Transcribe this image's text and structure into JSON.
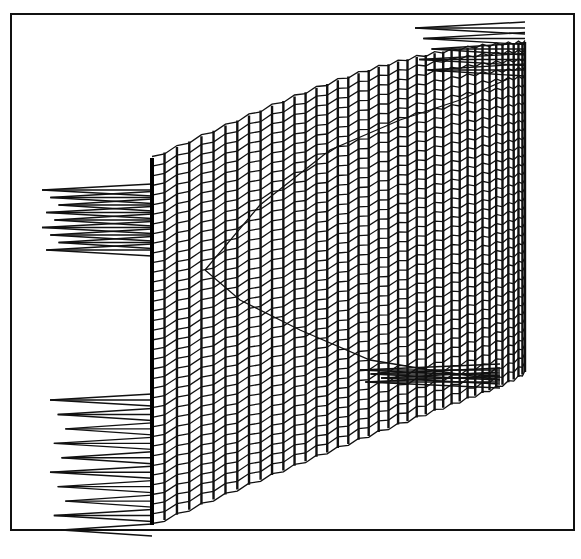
{
  "chart_data": {
    "type": "3d-wireframe-surface",
    "title": "",
    "xlabel": "",
    "ylabel": "",
    "zlabel": "",
    "legend": [],
    "grid": false,
    "colors": {
      "background": "#ffffff",
      "lines": "#111111",
      "frame": "#111111"
    },
    "frame": {
      "x": 10,
      "y": 13,
      "width": 565,
      "height": 518
    },
    "surface": {
      "columns": 40,
      "x_left": 152,
      "x_right": 525,
      "top_left_y": 158,
      "top_right_y": 42,
      "bottom_left_y": 525,
      "bottom_right_y": 372,
      "curvature": 55,
      "rows": 38,
      "wave_amplitude": 3
    },
    "inner_fold": {
      "description": "parabolic fold line crossing the surface",
      "points": [
        [
          205,
          270
        ],
        [
          260,
          205
        ],
        [
          330,
          150
        ],
        [
          400,
          120
        ],
        [
          460,
          100
        ],
        [
          510,
          78
        ]
      ],
      "lower_points": [
        [
          205,
          270
        ],
        [
          240,
          300
        ],
        [
          300,
          330
        ],
        [
          370,
          360
        ],
        [
          430,
          370
        ],
        [
          500,
          380
        ]
      ]
    },
    "spike_fans": [
      {
        "name": "upper-left-fan",
        "apex_x": 152,
        "y_top": 190,
        "y_bottom": 250,
        "reach_x": 42,
        "count": 9
      },
      {
        "name": "lower-left-fan",
        "apex_x": 152,
        "y_top": 400,
        "y_bottom": 530,
        "reach_x": 50,
        "count": 10
      },
      {
        "name": "top-right-fan",
        "apex_x": 525,
        "y_top": 28,
        "y_bottom": 70,
        "reach_x": 415,
        "count": 5
      },
      {
        "name": "right-mid-fan",
        "apex_x": 500,
        "y_top": 370,
        "y_bottom": 382,
        "reach_x": 360,
        "count": 4
      }
    ],
    "annotations": []
  }
}
